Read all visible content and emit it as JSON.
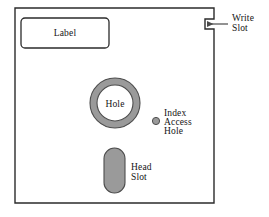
{
  "diagram": {
    "colors": {
      "outline": "#2b2b2b",
      "fill": "#ffffff",
      "component_gray": "#9a9a9a",
      "component_gray_stroke": "#4d4d4d",
      "text": "#141414",
      "leader_line": "#4a4a4a"
    },
    "jacket": {
      "name": "disk-jacket",
      "x": 15,
      "y": 8,
      "width": 199,
      "height": 195,
      "notch": {
        "name": "write-protect-notch",
        "edge": "right",
        "y_top": 19,
        "y_bottom": 29,
        "depth": 9
      }
    },
    "label_box": {
      "name": "disk-label",
      "text": "Label",
      "x": 21,
      "y": 18,
      "width": 88,
      "height": 30,
      "corner_radius": 4
    },
    "center_hole": {
      "name": "center-hub-hole",
      "text": "Hole",
      "cx": 115,
      "cy": 103,
      "outer_r": 25,
      "inner_r": 18
    },
    "index_hole": {
      "name": "index-access-hole",
      "cx": 156,
      "cy": 121,
      "r": 3.6,
      "text_lines": [
        "Index",
        "Access",
        "Hole"
      ],
      "text_x": 164,
      "text_y": 113
    },
    "head_slot": {
      "name": "head-slot",
      "x": 104,
      "y": 148,
      "width": 21,
      "height": 45,
      "corner_radius": 10.5,
      "text_lines": [
        "Head",
        "Slot"
      ],
      "text_x": 131,
      "text_y": 166
    },
    "write_slot_annotation": {
      "name": "write-slot-annotation",
      "text_lines": [
        "Write",
        "Slot"
      ],
      "text_x": 232,
      "text_y": 20,
      "arrow": {
        "x_start": 228,
        "x_end": 207,
        "y": 24
      }
    }
  }
}
